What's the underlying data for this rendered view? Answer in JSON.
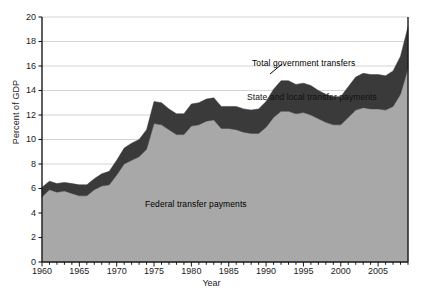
{
  "chart_data": {
    "type": "area",
    "title": "",
    "xlabel": "Year",
    "ylabel": "Percent of GDP",
    "xlim": [
      1960,
      2009
    ],
    "ylim": [
      0,
      20
    ],
    "grid": true,
    "stacked": true,
    "legend_position": "inline-annotations",
    "yticks": [
      0,
      2,
      4,
      6,
      8,
      10,
      12,
      14,
      16,
      18,
      20
    ],
    "ytick_labels": [
      "0",
      "2",
      "4",
      "6",
      "8",
      "10",
      "12",
      "14",
      "16",
      "18",
      "20"
    ],
    "xticks": [
      1960,
      1965,
      1970,
      1975,
      1980,
      1985,
      1990,
      1995,
      2000,
      2005
    ],
    "xtick_labels": [
      "1960",
      "1965",
      "1970",
      "1975",
      "1980",
      "1985",
      "1990",
      "1995",
      "2000",
      "2005"
    ],
    "x": [
      1960,
      1961,
      1962,
      1963,
      1964,
      1965,
      1966,
      1967,
      1968,
      1969,
      1970,
      1971,
      1972,
      1973,
      1974,
      1975,
      1976,
      1977,
      1978,
      1979,
      1980,
      1981,
      1982,
      1983,
      1984,
      1985,
      1986,
      1987,
      1988,
      1989,
      1990,
      1991,
      1992,
      1993,
      1994,
      1995,
      1996,
      1997,
      1998,
      1999,
      2000,
      2001,
      2002,
      2003,
      2004,
      2005,
      2006,
      2007,
      2008,
      2009
    ],
    "series": [
      {
        "name": "Federal transfer payments",
        "color": "#a8a8a8",
        "values": [
          5.3,
          5.9,
          5.7,
          5.8,
          5.6,
          5.4,
          5.4,
          5.9,
          6.2,
          6.3,
          7.1,
          8.0,
          8.3,
          8.6,
          9.2,
          11.3,
          11.2,
          10.8,
          10.4,
          10.4,
          11.1,
          11.2,
          11.5,
          11.6,
          10.9,
          10.9,
          10.8,
          10.6,
          10.5,
          10.5,
          11.0,
          11.8,
          12.3,
          12.3,
          12.1,
          12.2,
          12.0,
          11.7,
          11.4,
          11.2,
          11.2,
          11.8,
          12.4,
          12.6,
          12.5,
          12.5,
          12.4,
          12.7,
          13.7,
          15.8
        ]
      },
      {
        "name": "State and local transfer payments",
        "color": "#3a3a3a",
        "values": [
          0.8,
          0.7,
          0.7,
          0.7,
          0.8,
          0.9,
          0.9,
          0.9,
          1.0,
          1.1,
          1.2,
          1.3,
          1.4,
          1.4,
          1.6,
          1.8,
          1.8,
          1.7,
          1.7,
          1.7,
          1.8,
          1.8,
          1.8,
          1.8,
          1.8,
          1.8,
          1.9,
          1.9,
          1.9,
          2.0,
          2.1,
          2.3,
          2.5,
          2.5,
          2.4,
          2.4,
          2.4,
          2.3,
          2.3,
          2.3,
          2.3,
          2.5,
          2.7,
          2.8,
          2.8,
          2.8,
          2.8,
          2.9,
          3.1,
          3.4
        ]
      }
    ],
    "totals_name": "Total government transfers",
    "annotations": [
      {
        "text": "Total government transfers",
        "x": 1993,
        "y": 15.2
      },
      {
        "text": "State and local transfer payments",
        "x": 1993,
        "y": 13.0
      },
      {
        "text": "Federal transfer payments",
        "x": 1978,
        "y": 5.1
      }
    ]
  }
}
